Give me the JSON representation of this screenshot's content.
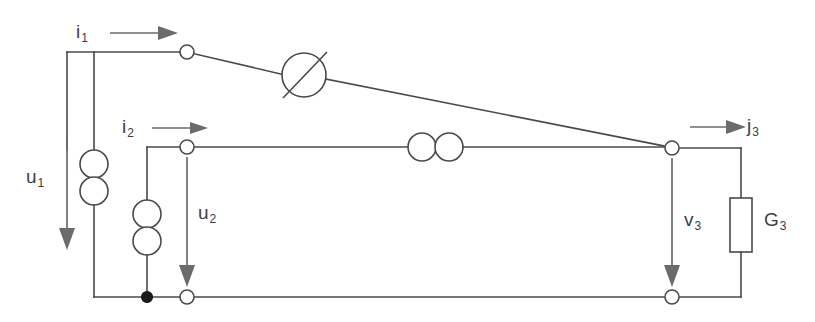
{
  "diagram": {
    "colors": {
      "wire": "#4a4a4a",
      "annotation": "#6b6b6b",
      "label": "#3d3d3d",
      "background": "#ffffff",
      "junction": "#1a1a1a"
    },
    "labels": {
      "i1": "i",
      "i1_sub": "1",
      "i2": "i",
      "i2_sub": "2",
      "j3": "j",
      "j3_sub": "3",
      "u1": "u",
      "u1_sub": "1",
      "u2": "u",
      "u2_sub": "2",
      "v3": "v",
      "v3_sub": "3",
      "g3": "G",
      "g3_sub": "3"
    },
    "elements": [
      {
        "name": "source-1",
        "type": "double-circle-vertical",
        "label": "u1-branch-source"
      },
      {
        "name": "source-2",
        "type": "double-circle-vertical",
        "label": "u2-branch-source"
      },
      {
        "name": "variable-element",
        "type": "circle-with-diagonal",
        "label": "top-branch-variable"
      },
      {
        "name": "coupler",
        "type": "double-circle-horizontal",
        "label": "middle-branch-coupler"
      },
      {
        "name": "conductance-g3",
        "type": "rectangle",
        "label": "G3"
      }
    ],
    "terminals": [
      {
        "name": "node-top-left",
        "x": 187,
        "y": 52
      },
      {
        "name": "node-middle-left",
        "x": 187,
        "y": 147
      },
      {
        "name": "node-right-top",
        "x": 672,
        "y": 148
      },
      {
        "name": "node-bottom-middle",
        "x": 187,
        "y": 297
      },
      {
        "name": "node-bottom-right",
        "x": 672,
        "y": 297
      },
      {
        "name": "junction-bottom",
        "x": 147,
        "y": 297
      }
    ]
  }
}
